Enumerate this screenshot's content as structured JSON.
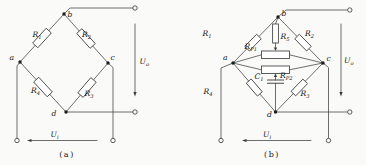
{
  "figure": {
    "background": "#fafaf8",
    "wire_color": "#4a4a4a",
    "text_color": "#141414"
  },
  "panel_a": {
    "caption": "(a)",
    "nodes": {
      "a": "a",
      "b": "b",
      "c": "c",
      "d": "d"
    },
    "components": {
      "r1": {
        "base": "R",
        "sub": "1"
      },
      "r2": {
        "base": "R",
        "sub": "2"
      },
      "r3": {
        "base": "R",
        "sub": "3"
      },
      "r4": {
        "base": "R",
        "sub": "4"
      }
    },
    "signals": {
      "uo": {
        "base": "U",
        "sub": "o"
      },
      "ui": {
        "base": "U",
        "sub": "i"
      }
    }
  },
  "panel_b": {
    "caption": "(b)",
    "nodes": {
      "a": "a",
      "b": "b",
      "c": "c",
      "d": "d"
    },
    "components": {
      "r1": {
        "base": "R",
        "sub": "1"
      },
      "r2": {
        "base": "R",
        "sub": "2"
      },
      "r3": {
        "base": "R",
        "sub": "3"
      },
      "r4": {
        "base": "R",
        "sub": "4"
      },
      "r5": {
        "base": "R",
        "sub": "5"
      },
      "rp1": {
        "base": "R",
        "sub": "P1"
      },
      "rp2": {
        "base": "R",
        "sub": "P2"
      },
      "c1": {
        "base": "C",
        "sub": "1"
      }
    },
    "signals": {
      "uo": {
        "base": "U",
        "sub": "o"
      },
      "ui": {
        "base": "U",
        "sub": "i"
      }
    }
  }
}
